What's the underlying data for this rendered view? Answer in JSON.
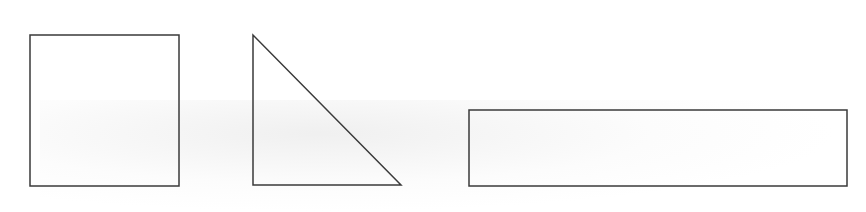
{
  "diagram": {
    "stroke_color": "#3a3a3a",
    "fill_color": "#ffffff",
    "stroke_width": 1.5,
    "shapes": [
      {
        "type": "square",
        "name": "square",
        "x": 30,
        "y": 35,
        "width": 149,
        "height": 151
      },
      {
        "type": "right-triangle",
        "name": "triangle",
        "points": [
          [
            253,
            35
          ],
          [
            253,
            185
          ],
          [
            401,
            185
          ]
        ]
      },
      {
        "type": "rectangle",
        "name": "rectangle",
        "x": 469,
        "y": 110,
        "width": 378,
        "height": 76
      }
    ]
  }
}
